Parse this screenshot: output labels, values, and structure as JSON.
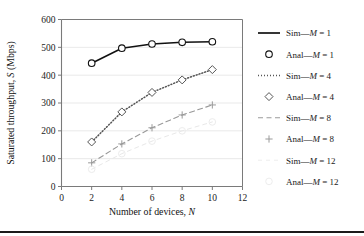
{
  "chart_data": {
    "type": "line",
    "title": "",
    "xlabel": "Number of devices, N",
    "ylabel": "Saturated throughput, S (Mbps)",
    "xlim": [
      0,
      12
    ],
    "ylim": [
      0,
      600
    ],
    "xticks": [
      0,
      2,
      4,
      6,
      8,
      10,
      12
    ],
    "yticks": [
      0,
      100,
      200,
      300,
      400,
      500,
      600
    ],
    "grid": "horizontal",
    "legend_position": "right",
    "x": [
      2,
      4,
      6,
      8,
      10
    ],
    "series": [
      {
        "name": "Sim—M = 1",
        "style": "solid",
        "marker": "none",
        "values": [
          443,
          497,
          512,
          518,
          520
        ],
        "color": "#111111"
      },
      {
        "name": "Anal—M = 1",
        "style": "none",
        "marker": "circle",
        "values": [
          443,
          497,
          512,
          518,
          520
        ],
        "color": "#111111"
      },
      {
        "name": "Sim—M = 4",
        "style": "dotted",
        "marker": "none",
        "values": [
          160,
          268,
          338,
          383,
          420
        ],
        "color": "#555555"
      },
      {
        "name": "Anal—M = 4",
        "style": "none",
        "marker": "diamond",
        "values": [
          160,
          268,
          338,
          383,
          420
        ],
        "color": "#555555"
      },
      {
        "name": "Sim—M = 8",
        "style": "dashed",
        "marker": "none",
        "values": [
          85,
          153,
          211,
          257,
          293
        ],
        "color": "#999999"
      },
      {
        "name": "Anal—M = 8",
        "style": "none",
        "marker": "plus",
        "values": [
          85,
          153,
          211,
          257,
          293
        ],
        "color": "#999999"
      },
      {
        "name": "Sim—M = 12",
        "style": "faint",
        "marker": "none",
        "values": [
          62,
          118,
          163,
          200,
          232
        ],
        "color": "#e8e8e8"
      },
      {
        "name": "Anal—M = 12",
        "style": "none",
        "marker": "faint-circle",
        "values": [
          62,
          118,
          163,
          200,
          232
        ],
        "color": "#ececec"
      }
    ]
  },
  "axes": {
    "y_title": "Saturated throughput, S (Mbps)",
    "y_title_main": "Saturated throughput, ",
    "y_title_sym": "S",
    "y_title_unit": " (Mbps)",
    "x_title_main": "Number of devices, ",
    "x_title_sym": "N",
    "yticks": {
      "t0": "0",
      "t1": "100",
      "t2": "200",
      "t3": "300",
      "t4": "400",
      "t5": "500",
      "t6": "600"
    },
    "xticks": {
      "t0": "0",
      "t1": "2",
      "t2": "4",
      "t3": "6",
      "t4": "8",
      "t5": "10",
      "t6": "12"
    }
  },
  "legend": {
    "items": [
      {
        "prefix": "Sim",
        "sym": "M",
        "eq": " = 1",
        "marker": "solid-line"
      },
      {
        "prefix": "Anal",
        "sym": "M",
        "eq": " = 1",
        "marker": "circle"
      },
      {
        "prefix": "Sim",
        "sym": "M",
        "eq": " = 4",
        "marker": "dotted-line"
      },
      {
        "prefix": "Anal",
        "sym": "M",
        "eq": " = 4",
        "marker": "diamond"
      },
      {
        "prefix": "Sim",
        "sym": "M",
        "eq": " = 8",
        "marker": "dashed-line"
      },
      {
        "prefix": "Anal",
        "sym": "M",
        "eq": " = 8",
        "marker": "plus"
      },
      {
        "prefix": "Sim",
        "sym": "M",
        "eq": " = 12",
        "marker": "faint-line"
      },
      {
        "prefix": "Anal",
        "sym": "M",
        "eq": " = 12",
        "marker": "faint-circle"
      }
    ]
  },
  "colors": {
    "axis": "#7a7a7a",
    "grid": "#e3e3e3",
    "series1": "#111111",
    "series4": "#555555",
    "series8": "#9a9a9a",
    "series12": "#ededed",
    "rule": "#1b1b1b"
  }
}
